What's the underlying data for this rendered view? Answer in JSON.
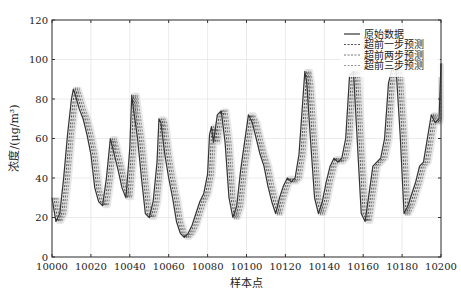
{
  "chart_data": {
    "type": "line",
    "title": "",
    "xlabel": "样本点",
    "ylabel": "浓度/(μg/m³)",
    "xlim": [
      10000,
      10200
    ],
    "ylim": [
      0,
      120
    ],
    "xticks": [
      10000,
      10020,
      10040,
      10060,
      10080,
      10100,
      10120,
      10140,
      10160,
      10180,
      10200
    ],
    "yticks": [
      0,
      20,
      40,
      60,
      80,
      100,
      120
    ],
    "grid": true,
    "legend_position": "upper right",
    "series": [
      {
        "name": "原始数据",
        "style": "solid",
        "color": "#333333",
        "x": [
          10000,
          10002,
          10004,
          10006,
          10008,
          10010,
          10011,
          10012,
          10014,
          10016,
          10018,
          10020,
          10022,
          10024,
          10026,
          10028,
          10030,
          10032,
          10034,
          10036,
          10038,
          10040,
          10041,
          10042,
          10044,
          10046,
          10048,
          10050,
          10052,
          10054,
          10055,
          10056,
          10058,
          10060,
          10062,
          10064,
          10066,
          10068,
          10070,
          10072,
          10074,
          10076,
          10078,
          10080,
          10081,
          10082,
          10083,
          10085,
          10087,
          10089,
          10091,
          10093,
          10095,
          10097,
          10099,
          10101,
          10103,
          10105,
          10107,
          10109,
          10111,
          10113,
          10115,
          10117,
          10119,
          10121,
          10123,
          10125,
          10127,
          10129,
          10130,
          10131,
          10133,
          10135,
          10137,
          10139,
          10141,
          10143,
          10145,
          10147,
          10149,
          10151,
          10153,
          10155,
          10157,
          10159,
          10161,
          10163,
          10165,
          10167,
          10169,
          10171,
          10173,
          10175,
          10177,
          10179,
          10181,
          10183,
          10185,
          10187,
          10189,
          10191,
          10193,
          10195,
          10197,
          10199,
          10200
        ],
        "values": [
          30,
          18,
          22,
          40,
          62,
          80,
          85,
          82,
          75,
          70,
          62,
          52,
          35,
          28,
          26,
          40,
          60,
          52,
          44,
          35,
          30,
          55,
          82,
          74,
          60,
          40,
          22,
          20,
          28,
          48,
          70,
          68,
          52,
          40,
          30,
          18,
          12,
          10,
          12,
          16,
          22,
          28,
          32,
          42,
          62,
          66,
          58,
          72,
          74,
          58,
          30,
          20,
          26,
          44,
          58,
          72,
          68,
          60,
          52,
          46,
          36,
          28,
          22,
          30,
          36,
          40,
          38,
          40,
          52,
          80,
          94,
          88,
          58,
          30,
          22,
          28,
          38,
          46,
          50,
          48,
          50,
          60,
          92,
          94,
          58,
          22,
          18,
          32,
          46,
          48,
          50,
          60,
          88,
          96,
          94,
          62,
          22,
          26,
          32,
          38,
          46,
          48,
          60,
          72,
          68,
          70,
          98
        ]
      },
      {
        "name": "超前一步预测",
        "style": "dashed",
        "color": "#555555",
        "shift": 1
      },
      {
        "name": "超前两步预测",
        "style": "dashed",
        "color": "#777777",
        "shift": 2
      },
      {
        "name": "超前三步预测",
        "style": "dashed",
        "color": "#999999",
        "shift": 3
      }
    ]
  },
  "axes": {
    "xlabel": "样本点",
    "ylabel": "浓度/(μg/m³)",
    "xticks": [
      "10000",
      "10020",
      "10040",
      "10060",
      "10080",
      "10100",
      "10120",
      "10140",
      "10160",
      "10180",
      "10200"
    ],
    "yticks": [
      "0",
      "20",
      "40",
      "60",
      "80",
      "100",
      "120"
    ]
  },
  "legend": {
    "items": [
      "原始数据",
      "超前一步预测",
      "超前两步预测",
      "超前三步预测"
    ]
  }
}
